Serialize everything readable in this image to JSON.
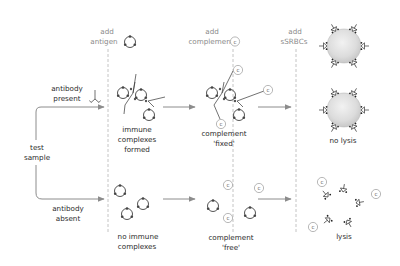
{
  "diagram": {
    "input": {
      "label_line1": "test",
      "label_line2": "sample"
    },
    "branches": {
      "present": {
        "label_line1": "antibody",
        "label_line2": "present"
      },
      "absent": {
        "label_line1": "antibody",
        "label_line2": "absent"
      }
    },
    "steps": [
      {
        "label_line1": "add",
        "label_line2": "antigen",
        "icon": "antigen-icon"
      },
      {
        "label_line1": "add",
        "label_line2": "complement",
        "icon": "complement-icon",
        "icon_text": "C"
      },
      {
        "label_line1": "add",
        "label_line2": "sSRBCs"
      }
    ],
    "top_row": {
      "stage1": {
        "line1": "immune",
        "line2": "complexes",
        "line3": "formed"
      },
      "stage2": {
        "line1": "complement",
        "line2": "'fixed'"
      },
      "stage3": {
        "line1": "no lysis"
      }
    },
    "bottom_row": {
      "stage1": {
        "line1": "no immune",
        "line2": "complexes"
      },
      "stage2": {
        "line1": "complement",
        "line2": "'free'"
      },
      "stage3": {
        "line1": "lysis"
      }
    },
    "complement_symbol": "C",
    "colors": {
      "text": "#2b2b2b",
      "header_text": "#8a8a8a",
      "arrow": "#8c8c8c",
      "dashed_divider": "#b5b5b5",
      "cell_fill": "#e2e2e2"
    }
  }
}
